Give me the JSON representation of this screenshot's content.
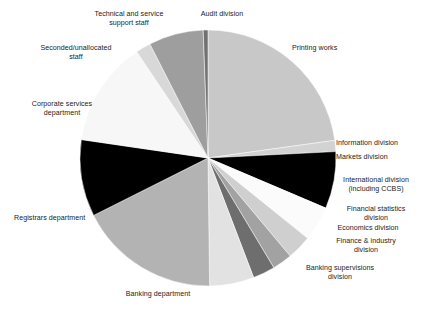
{
  "chart_data": {
    "type": "pie",
    "title": "",
    "subtitle": "",
    "xlabel": "",
    "ylabel": "",
    "legend_position": "callout-labels",
    "grid": false,
    "start_angle_deg": 0,
    "direction": "clockwise",
    "center": [
      208,
      158
    ],
    "radius": 128,
    "categories": [
      "Printing works",
      "Information division",
      "Markets division",
      "International division (including CCBS)",
      "Financial statistics division",
      "Economics division",
      "Finance & industry division",
      "Banking supervisions division",
      "Banking department",
      "Registrars department",
      "Corporate services department",
      "Seconded/unallocated staff",
      "Technical and service support staff",
      "Audit division"
    ],
    "values": [
      22.8,
      1.4,
      7.2,
      4.4,
      3.1,
      2.5,
      2.8,
      5.6,
      17.8,
      9.7,
      13.3,
      1.9,
      6.9,
      0.6
    ],
    "colors": [
      "#c8c8c8",
      "#d2d2d2",
      "#000000",
      "#fbfbfb",
      "#cfcfcf",
      "#a2a2a2",
      "#6e6e6e",
      "#e2e2e2",
      "#b3b3b3",
      "#000000",
      "#f7f7f7",
      "#d8d8d8",
      "#9e9e9e",
      "#717171"
    ]
  },
  "labels": [
    {
      "name": "technical-and-service-support-staff",
      "text": "Technical and service\nsupport staff",
      "x": 74,
      "y": 10,
      "w": 110,
      "align": "c"
    },
    {
      "name": "audit-division",
      "text": "Audit division",
      "x": 186,
      "y": 10,
      "w": 72,
      "align": "c"
    },
    {
      "name": "printing-works",
      "text": "Printing works",
      "x": 292,
      "y": 44,
      "w": 76,
      "align": "l"
    },
    {
      "name": "seconded-unallocated-staff",
      "text": "Seconded/unallocated\nstaff",
      "x": 22,
      "y": 44,
      "w": 108,
      "align": "c"
    },
    {
      "name": "corporate-services-department",
      "text": "Corporate services\ndepartment",
      "x": 14,
      "y": 100,
      "w": 96,
      "align": "c"
    },
    {
      "name": "information-division",
      "text": "Information division",
      "x": 336,
      "y": 139,
      "w": 86,
      "align": "l"
    },
    {
      "name": "markets-division",
      "text": "Markets division",
      "x": 336,
      "y": 153,
      "w": 86,
      "align": "l"
    },
    {
      "name": "international-division",
      "text": "International division\n(including CCBS)",
      "x": 330,
      "y": 176,
      "w": 92,
      "align": "c"
    },
    {
      "name": "financial-statistics-division",
      "text": "Financial statistics\ndivision",
      "x": 330,
      "y": 205,
      "w": 92,
      "align": "c"
    },
    {
      "name": "economics-division",
      "text": "Economics division",
      "x": 320,
      "y": 224,
      "w": 96,
      "align": "c"
    },
    {
      "name": "finance-and-industry-division",
      "text": "Finance & industry\ndivision",
      "x": 318,
      "y": 237,
      "w": 96,
      "align": "c"
    },
    {
      "name": "banking-supervisions-division",
      "text": "Banking supervisions\ndivision",
      "x": 286,
      "y": 264,
      "w": 108,
      "align": "c"
    },
    {
      "name": "registrars-department",
      "text": "Registrars department",
      "x": 14,
      "y": 214,
      "w": 104,
      "align": "l"
    },
    {
      "name": "banking-department",
      "text": "Banking department",
      "x": 106,
      "y": 290,
      "w": 104,
      "align": "c"
    }
  ]
}
